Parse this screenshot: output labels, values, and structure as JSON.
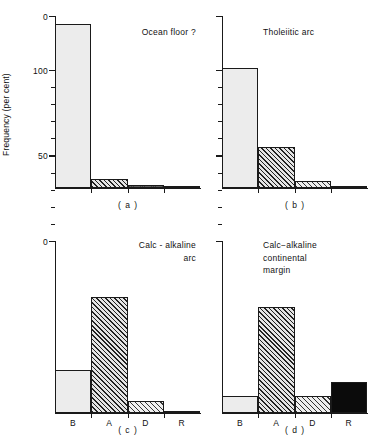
{
  "figure": {
    "ylabel": "Frequency (per cent)",
    "categories": [
      "B",
      "A",
      "D",
      "R"
    ],
    "y_ticks_major": [
      0,
      50,
      100
    ],
    "y_tick_labels": [
      "0",
      "50",
      "100"
    ],
    "y_minor_step": 10,
    "ylim": [
      0,
      100
    ]
  },
  "chart_data": [
    {
      "type": "bar",
      "panel": "a",
      "caption": "( a )",
      "title": "Ocean floor ?",
      "categories": [
        "B",
        "A",
        "D",
        "R"
      ],
      "values": [
        96,
        5,
        1.5,
        1
      ],
      "patterns": [
        "stipple",
        "hatch-dense",
        "dots",
        "black"
      ],
      "xlabel": "",
      "ylabel": "Frequency (per cent)",
      "ylim": [
        0,
        100
      ],
      "grid": false,
      "legend": "none"
    },
    {
      "type": "bar",
      "panel": "b",
      "caption": "( b )",
      "title": "Tholeiitic arc",
      "categories": [
        "B",
        "A",
        "D",
        "R"
      ],
      "values": [
        70,
        24,
        4,
        1
      ],
      "patterns": [
        "stipple",
        "hatch-dense",
        "hatch-light",
        "black"
      ],
      "xlabel": "",
      "ylabel": "Frequency (per cent)",
      "ylim": [
        0,
        100
      ],
      "grid": false,
      "legend": "none"
    },
    {
      "type": "bar",
      "panel": "c",
      "caption": "( c )",
      "title": "Calc - alkaline\narc",
      "categories": [
        "B",
        "A",
        "D",
        "R"
      ],
      "values": [
        25,
        68,
        7,
        1
      ],
      "patterns": [
        "stipple",
        "hatch-dense",
        "hatch-light",
        "black"
      ],
      "xlabel": "",
      "ylabel": "Frequency (per cent)",
      "ylim": [
        0,
        100
      ],
      "grid": false,
      "legend": "none"
    },
    {
      "type": "bar",
      "panel": "d",
      "caption": "( d )",
      "title": "Calc−alkaline\ncontinental\nmargin",
      "categories": [
        "B",
        "A",
        "D",
        "R"
      ],
      "values": [
        10,
        62,
        10,
        18
      ],
      "patterns": [
        "stipple",
        "hatch-dense",
        "hatch-light",
        "black"
      ],
      "xlabel": "",
      "ylabel": "Frequency (per cent)",
      "ylim": [
        0,
        100
      ],
      "grid": false,
      "legend": "none"
    }
  ]
}
